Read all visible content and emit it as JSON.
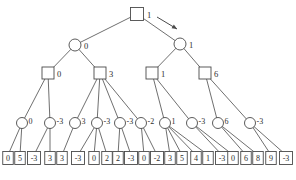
{
  "diagram": {
    "type": "minimax-game-tree",
    "colors": {
      "stroke": "#4a4a4a",
      "node_fill": "#ffffff",
      "text": "#2e2e2e"
    },
    "root": {
      "shape": "square",
      "value": "1",
      "x": 137,
      "y": 14
    },
    "arrow": {
      "x1": 157,
      "y1": 17,
      "x2": 177,
      "y2": 29
    },
    "level1_circles": [
      {
        "value": "0",
        "x": 75,
        "y": 45
      },
      {
        "value": "1",
        "x": 180,
        "y": 44
      }
    ],
    "level2_squares": [
      {
        "value": "0",
        "x": 48,
        "y": 73,
        "parent": 0
      },
      {
        "value": "3",
        "x": 100,
        "y": 73,
        "parent": 0
      },
      {
        "value": "1",
        "x": 152,
        "y": 73,
        "parent": 1
      },
      {
        "value": "6",
        "x": 205,
        "y": 73,
        "parent": 1
      }
    ],
    "level3_circles": [
      {
        "value": "0",
        "x": 22,
        "y": 123,
        "parent": 0
      },
      {
        "value": "-3",
        "x": 50,
        "y": 123,
        "parent": 0
      },
      {
        "value": "3",
        "x": 75,
        "y": 123,
        "parent": 1
      },
      {
        "value": "-3",
        "x": 97,
        "y": 123,
        "parent": 1
      },
      {
        "value": "-3",
        "x": 120,
        "y": 123,
        "parent": 1
      },
      {
        "value": "-2",
        "x": 141,
        "y": 123,
        "parent": 1
      },
      {
        "value": "1",
        "x": 165,
        "y": 123,
        "parent": 2
      },
      {
        "value": "-3",
        "x": 192,
        "y": 123,
        "parent": 2
      },
      {
        "value": "6",
        "x": 218,
        "y": 123,
        "parent": 3
      },
      {
        "value": "-3",
        "x": 250,
        "y": 123,
        "parent": 3
      }
    ],
    "leaves": [
      {
        "value": "0",
        "x": 8,
        "parent": 0
      },
      {
        "value": "5",
        "x": 20,
        "parent": 0
      },
      {
        "value": "-3",
        "x": 34,
        "parent": 1
      },
      {
        "value": "3",
        "x": 50,
        "parent": 1
      },
      {
        "value": "3",
        "x": 62,
        "parent": 2
      },
      {
        "value": "-3",
        "x": 78,
        "parent": 3
      },
      {
        "value": "0",
        "x": 94,
        "parent": 3
      },
      {
        "value": "2",
        "x": 107,
        "parent": 3
      },
      {
        "value": "2",
        "x": 118,
        "parent": 4
      },
      {
        "value": "-3",
        "x": 131,
        "parent": 4
      },
      {
        "value": "0",
        "x": 144,
        "parent": 5
      },
      {
        "value": "-2",
        "x": 157,
        "parent": 5
      },
      {
        "value": "3",
        "x": 170,
        "parent": 6
      },
      {
        "value": "5",
        "x": 182,
        "parent": 6
      },
      {
        "value": "4",
        "x": 196,
        "parent": 6
      },
      {
        "value": "1",
        "x": 208,
        "parent": 6
      },
      {
        "value": "-3",
        "x": 222,
        "parent": 7
      },
      {
        "value": "0",
        "x": 233,
        "parent": 7
      },
      {
        "value": "6",
        "x": 246,
        "parent": 8
      },
      {
        "value": "8",
        "x": 258,
        "parent": 8
      },
      {
        "value": "9",
        "x": 271,
        "parent": 9
      },
      {
        "value": "-3",
        "x": 286,
        "parent": 9
      }
    ],
    "leaf_y": 158
  }
}
